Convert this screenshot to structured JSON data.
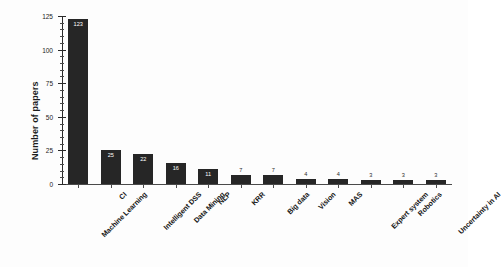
{
  "chart_data": {
    "type": "bar",
    "title": "",
    "xlabel": "",
    "ylabel": "Number of papers",
    "ylim": [
      0,
      125
    ],
    "yticks": [
      0,
      25,
      50,
      75,
      100,
      125
    ],
    "ytick_labels": [
      "0",
      "25",
      "50",
      "75",
      "100",
      "125"
    ],
    "minor_tick_step": 5,
    "grid": false,
    "legend": false,
    "bar_color": "#262626",
    "categories": [
      "Machine Learning",
      "CI",
      "Intelligent DSS",
      "Data Mining",
      "NLP",
      "KRR",
      "Big data",
      "Vision",
      "MAS",
      "Expert system",
      "Robotics",
      "Uncertainty in AI"
    ],
    "values": [
      123,
      25,
      22,
      16,
      11,
      7,
      7,
      4,
      4,
      3,
      3,
      3
    ],
    "value_labels": [
      "123",
      "25",
      "22",
      "16",
      "11",
      "7",
      "7",
      "4",
      "4",
      "3",
      "3",
      "3"
    ]
  }
}
